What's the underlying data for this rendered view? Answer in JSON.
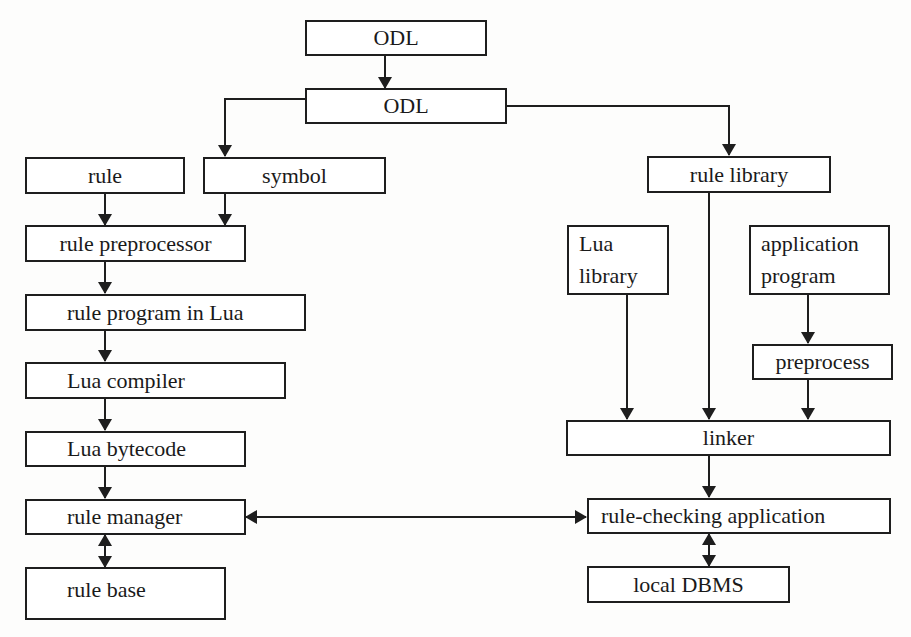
{
  "diagram": {
    "type": "flowchart",
    "colors": {
      "stroke": "#1e1e1e",
      "background": "#ffffff",
      "text": "#1a1a1a"
    },
    "nodes": {
      "odl_source": {
        "label": "ODL"
      },
      "odl_parsed": {
        "label": "ODL"
      },
      "rule": {
        "label": "rule"
      },
      "symbol": {
        "label": "symbol"
      },
      "rule_library": {
        "label": "rule library"
      },
      "rule_preprocessor": {
        "label": "rule preprocessor"
      },
      "lua_library": {
        "line1": "Lua",
        "line2": "library"
      },
      "application_program": {
        "line1": "application",
        "line2": "program"
      },
      "rule_program_in_lua": {
        "label": "rule program in Lua"
      },
      "preprocess": {
        "label": "preprocess"
      },
      "lua_compiler": {
        "label": "Lua compiler"
      },
      "linker": {
        "label": "linker"
      },
      "lua_bytecode": {
        "label": "Lua bytecode"
      },
      "rule_manager": {
        "label": "rule manager"
      },
      "rule_checking_application": {
        "label": "rule-checking application"
      },
      "rule_base": {
        "label": "rule base"
      },
      "local_dbms": {
        "label": "local DBMS"
      }
    },
    "edges": [
      {
        "from": "ODL",
        "to": "ODL",
        "direction": "one-way"
      },
      {
        "from": "ODL",
        "to": "symbol",
        "direction": "one-way"
      },
      {
        "from": "ODL",
        "to": "rule library",
        "direction": "one-way"
      },
      {
        "from": "rule",
        "to": "rule preprocessor",
        "direction": "one-way"
      },
      {
        "from": "symbol",
        "to": "rule preprocessor",
        "direction": "one-way"
      },
      {
        "from": "rule preprocessor",
        "to": "rule program in Lua",
        "direction": "one-way"
      },
      {
        "from": "rule program in Lua",
        "to": "Lua compiler",
        "direction": "one-way"
      },
      {
        "from": "Lua compiler",
        "to": "Lua bytecode",
        "direction": "one-way"
      },
      {
        "from": "Lua bytecode",
        "to": "rule manager",
        "direction": "one-way"
      },
      {
        "from": "rule manager",
        "to": "rule base",
        "direction": "two-way"
      },
      {
        "from": "Lua library",
        "to": "linker",
        "direction": "one-way"
      },
      {
        "from": "rule library",
        "to": "linker",
        "direction": "one-way"
      },
      {
        "from": "application program",
        "to": "preprocess",
        "direction": "one-way"
      },
      {
        "from": "preprocess",
        "to": "linker",
        "direction": "one-way"
      },
      {
        "from": "linker",
        "to": "rule-checking application",
        "direction": "one-way"
      },
      {
        "from": "rule manager",
        "to": "rule-checking application",
        "direction": "two-way"
      },
      {
        "from": "rule-checking application",
        "to": "local DBMS",
        "direction": "two-way"
      }
    ]
  }
}
